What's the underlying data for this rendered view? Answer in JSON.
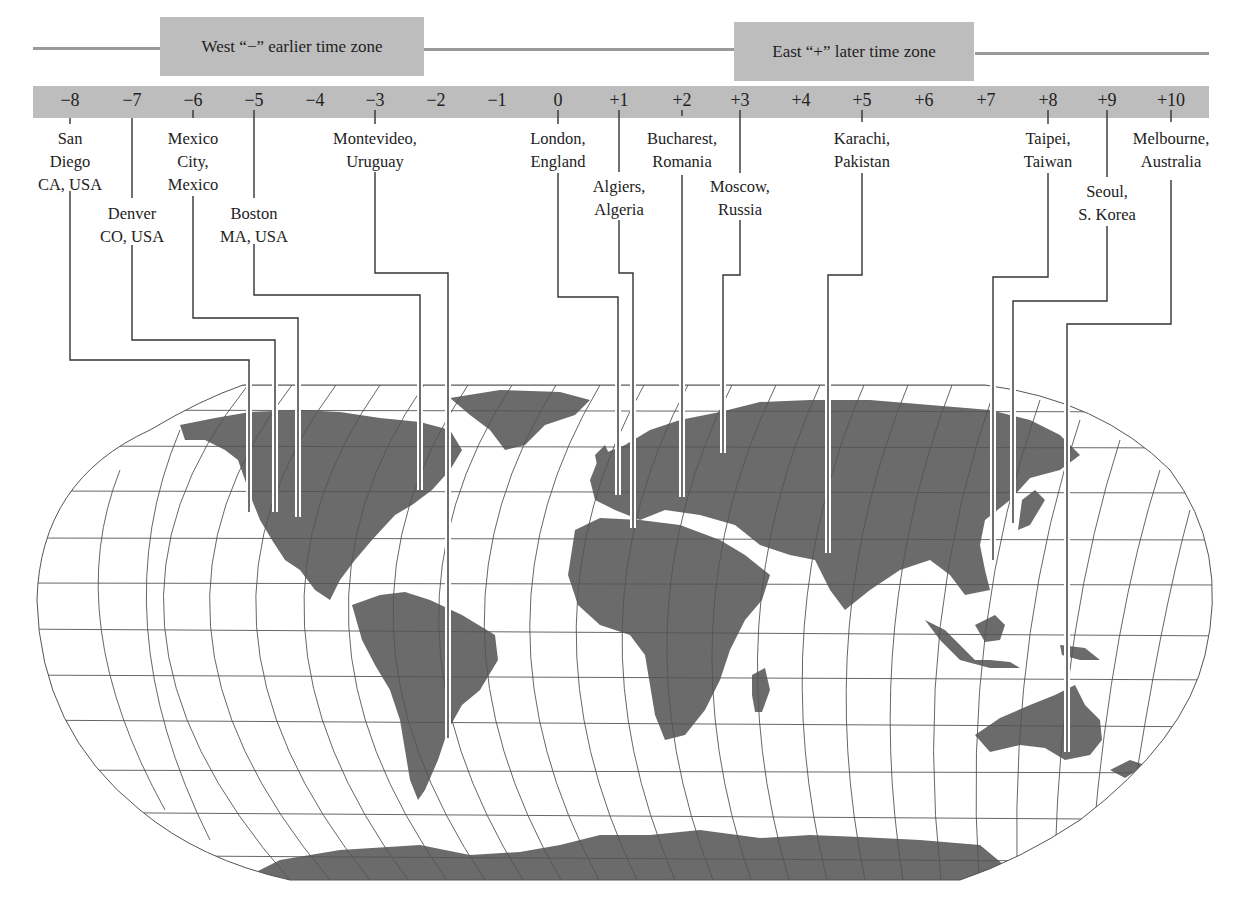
{
  "header": {
    "west_label": "West “−” earlier time zone",
    "east_label": "East “+” later time zone"
  },
  "offsets": [
    {
      "label": "−8",
      "x": 70
    },
    {
      "label": "−7",
      "x": 132
    },
    {
      "label": "−6",
      "x": 193
    },
    {
      "label": "−5",
      "x": 254
    },
    {
      "label": "−4",
      "x": 315
    },
    {
      "label": "−3",
      "x": 375
    },
    {
      "label": "−2",
      "x": 436
    },
    {
      "label": "−1",
      "x": 497
    },
    {
      "label": "0",
      "x": 558
    },
    {
      "label": "+1",
      "x": 619
    },
    {
      "label": "+2",
      "x": 682
    },
    {
      "label": "+3",
      "x": 740
    },
    {
      "label": "+4",
      "x": 801
    },
    {
      "label": "+5",
      "x": 862
    },
    {
      "label": "+6",
      "x": 924
    },
    {
      "label": "+7",
      "x": 986
    },
    {
      "label": "+8",
      "x": 1048
    },
    {
      "label": "+9",
      "x": 1107
    },
    {
      "label": "+10",
      "x": 1171
    }
  ],
  "cities": [
    {
      "name": "san-diego",
      "lines": [
        "San",
        "Diego",
        "CA, USA"
      ],
      "offset": "−8",
      "x": 70,
      "top": 127
    },
    {
      "name": "denver",
      "lines": [
        "Denver",
        "CO, USA"
      ],
      "offset": "−7",
      "x": 132,
      "top": 202
    },
    {
      "name": "mexico-city",
      "lines": [
        "Mexico",
        "City,",
        "Mexico"
      ],
      "offset": "−6",
      "x": 193,
      "top": 127
    },
    {
      "name": "boston",
      "lines": [
        "Boston",
        "MA, USA"
      ],
      "offset": "−5",
      "x": 254,
      "top": 202
    },
    {
      "name": "montevideo",
      "lines": [
        "Montevideo,",
        "Uruguay"
      ],
      "offset": "−3",
      "x": 375,
      "top": 127
    },
    {
      "name": "london",
      "lines": [
        "London,",
        "England"
      ],
      "offset": "0",
      "x": 558,
      "top": 127
    },
    {
      "name": "algiers",
      "lines": [
        "Algiers,",
        "Algeria"
      ],
      "offset": "+1",
      "x": 619,
      "top": 175
    },
    {
      "name": "bucharest",
      "lines": [
        "Bucharest,",
        "Romania"
      ],
      "offset": "+2",
      "x": 682,
      "top": 127
    },
    {
      "name": "moscow",
      "lines": [
        "Moscow,",
        "Russia"
      ],
      "offset": "+3",
      "x": 740,
      "top": 175
    },
    {
      "name": "karachi",
      "lines": [
        "Karachi,",
        "Pakistan"
      ],
      "offset": "+5",
      "x": 862,
      "top": 127
    },
    {
      "name": "taipei",
      "lines": [
        "Taipei,",
        "Taiwan"
      ],
      "offset": "+8",
      "x": 1048,
      "top": 127
    },
    {
      "name": "seoul",
      "lines": [
        "Seoul,",
        "S. Korea"
      ],
      "offset": "+9",
      "x": 1107,
      "top": 180
    },
    {
      "name": "melbourne",
      "lines": [
        "Melbourne,",
        "Australia"
      ],
      "offset": "+10",
      "x": 1171,
      "top": 127
    }
  ],
  "leaders": [
    {
      "city": "san-diego",
      "points": "70,118 70,124 M70,191 70,360 249,360 249,512"
    },
    {
      "city": "denver",
      "points": "132,118 132,198 M132,245 132,340 275,340 275,512"
    },
    {
      "city": "mexico-city",
      "points": "193,110 193,118 M193,196 193,318 298,318 298,517"
    },
    {
      "city": "boston",
      "points": "254,110 254,198 M254,244 254,295 420,295 420,490"
    },
    {
      "city": "montevideo",
      "points": "375,110 375,124 M375,172 375,273 448,273 448,738"
    },
    {
      "city": "london",
      "points": "558,110 558,124 M558,173 558,297 618,297 618,495"
    },
    {
      "city": "algiers",
      "points": "619,110 619,172 M619,220 619,273 633,273 633,528"
    },
    {
      "city": "bucharest",
      "points": "682,110 682,116 M682,175 682,497"
    },
    {
      "city": "moscow",
      "points": "740,110 740,173 M740,220 740,275 723,275 723,453"
    },
    {
      "city": "karachi",
      "points": "862,110 862,122 M862,173 862,275 828,275 828,553"
    },
    {
      "city": "taipei",
      "points": "1048,110 1048,124 M1048,173 1048,277 993,277 993,560"
    },
    {
      "city": "seoul",
      "points": "1107,110 1107,177 M1107,226 1107,301 1013,301 1013,523"
    },
    {
      "city": "melbourne",
      "points": "1171,110 1171,122 M1171,180 1171,324 1067,324 1067,752"
    }
  ],
  "map": {
    "projection": "world map (Robinson-style) with graticule",
    "land_color": "#6b6b6b",
    "grid_color": "#555555",
    "bar_color": "#bdbdbd"
  }
}
